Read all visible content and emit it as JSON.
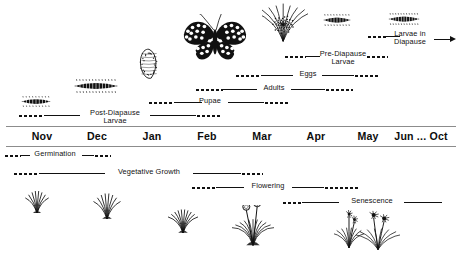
{
  "figure": {
    "ink_color": "#111111",
    "rule_color": "#8c8c8c",
    "background": "#ffffff"
  },
  "timeline": {
    "months": [
      {
        "label": "Nov",
        "x": 42
      },
      {
        "label": "Dec",
        "x": 97
      },
      {
        "label": "Jan",
        "x": 152
      },
      {
        "label": "Feb",
        "x": 207
      },
      {
        "label": "Mar",
        "x": 262
      },
      {
        "label": "Apr",
        "x": 316
      },
      {
        "label": "May",
        "x": 368
      },
      {
        "label": "Jun ... Oct",
        "x": 421
      }
    ]
  },
  "insect_stages": [
    {
      "name": "larvae-in-diapause",
      "label": "Larvae in\nDiapause",
      "label_line1": "Larvae in",
      "label_line2": "Diapause",
      "row_y": 36,
      "label_x": 410,
      "has_arrow": true,
      "segments": [
        {
          "kind": "dots",
          "x": 367,
          "w": 19
        },
        {
          "kind": "bar",
          "x": 386,
          "w": 14
        }
      ]
    },
    {
      "name": "pre-diapause-larvae",
      "label": "Pre-Diapause\nLarvae",
      "label_line1": "Pre-Diapause",
      "label_line2": "Larvae",
      "row_y": 56,
      "label_x": 343,
      "has_arrow": false,
      "segments": [
        {
          "kind": "dots",
          "x": 284,
          "w": 22
        },
        {
          "kind": "bar",
          "x": 306,
          "w": 14
        },
        {
          "kind": "dots",
          "x": 366,
          "w": 22
        }
      ]
    },
    {
      "name": "eggs",
      "label": "Eggs",
      "row_y": 75,
      "label_x": 308,
      "has_arrow": false,
      "segments": [
        {
          "kind": "dots",
          "x": 235,
          "w": 26
        },
        {
          "kind": "bar",
          "x": 261,
          "w": 32
        },
        {
          "kind": "bar",
          "x": 322,
          "w": 32
        },
        {
          "kind": "dots",
          "x": 354,
          "w": 26
        }
      ]
    },
    {
      "name": "adults",
      "label": "Adults",
      "row_y": 89,
      "label_x": 274,
      "has_arrow": false,
      "segments": [
        {
          "kind": "dots",
          "x": 195,
          "w": 28
        },
        {
          "kind": "bar",
          "x": 223,
          "w": 34
        },
        {
          "kind": "bar",
          "x": 291,
          "w": 34
        },
        {
          "kind": "dots",
          "x": 325,
          "w": 28
        }
      ]
    },
    {
      "name": "pupae",
      "label": "Pupae",
      "row_y": 102,
      "label_x": 210,
      "has_arrow": false,
      "segments": [
        {
          "kind": "dots",
          "x": 148,
          "w": 26
        },
        {
          "kind": "bar",
          "x": 174,
          "w": 28
        },
        {
          "kind": "bar",
          "x": 228,
          "w": 36
        },
        {
          "kind": "dots",
          "x": 264,
          "w": 26
        }
      ]
    },
    {
      "name": "post-diapause-larvae",
      "label": "Post-Diapause\nLarvae",
      "label_line1": "Post-Diapause",
      "label_line2": "Larvae",
      "row_y": 115,
      "label_x": 115,
      "has_arrow": false,
      "segments": [
        {
          "kind": "dots",
          "x": 18,
          "w": 26
        },
        {
          "kind": "bar",
          "x": 44,
          "w": 36
        },
        {
          "kind": "bar",
          "x": 150,
          "w": 46
        },
        {
          "kind": "dots",
          "x": 196,
          "w": 24
        }
      ]
    }
  ],
  "plant_stages": [
    {
      "name": "germination",
      "label": "Germination",
      "row_y": 155,
      "label_x": 55,
      "segments": [
        {
          "kind": "dots",
          "x": 4,
          "w": 17
        },
        {
          "kind": "bar",
          "x": 21,
          "w": 9
        },
        {
          "kind": "bar",
          "x": 82,
          "w": 12
        },
        {
          "kind": "dots",
          "x": 94,
          "w": 17
        }
      ]
    },
    {
      "name": "vegetative-growth",
      "label": "Vegetative Growth",
      "row_y": 173,
      "label_x": 149,
      "segments": [
        {
          "kind": "dots",
          "x": 13,
          "w": 26
        },
        {
          "kind": "bar",
          "x": 39,
          "w": 66
        },
        {
          "kind": "bar",
          "x": 193,
          "w": 48
        },
        {
          "kind": "dots",
          "x": 241,
          "w": 22
        }
      ]
    },
    {
      "name": "flowering",
      "label": "Flowering",
      "row_y": 187,
      "label_x": 268,
      "segments": [
        {
          "kind": "dots",
          "x": 191,
          "w": 25
        },
        {
          "kind": "bar",
          "x": 216,
          "w": 28
        },
        {
          "kind": "bar",
          "x": 292,
          "w": 32
        },
        {
          "kind": "dots",
          "x": 324,
          "w": 35
        }
      ]
    },
    {
      "name": "senescence",
      "label": "Senescence",
      "row_y": 202,
      "label_x": 372,
      "segments": [
        {
          "kind": "dots",
          "x": 282,
          "w": 20
        },
        {
          "kind": "bar",
          "x": 302,
          "w": 37
        },
        {
          "kind": "bar",
          "x": 404,
          "w": 38
        }
      ]
    }
  ],
  "illustrations": [
    {
      "name": "butterfly",
      "type": "butterfly",
      "x": 182,
      "y": 14,
      "w": 66,
      "h": 48
    },
    {
      "name": "larva-on-host-plant",
      "type": "larva-on-plant",
      "x": 262,
      "y": 2,
      "w": 46,
      "h": 40
    },
    {
      "name": "small-larva",
      "type": "larva-small",
      "x": 322,
      "y": 14,
      "w": 30,
      "h": 12
    },
    {
      "name": "diapause-larva",
      "type": "larva-diapause",
      "x": 387,
      "y": 13,
      "w": 34,
      "h": 12
    },
    {
      "name": "pupa",
      "type": "pupa",
      "x": 138,
      "y": 48,
      "w": 22,
      "h": 32
    },
    {
      "name": "post-diapause-larva-large",
      "type": "larva-large",
      "x": 72,
      "y": 79,
      "w": 48,
      "h": 14
    },
    {
      "name": "post-diapause-larva-small",
      "type": "larva-small2",
      "x": 20,
      "y": 96,
      "w": 32,
      "h": 11
    },
    {
      "name": "seedling-1",
      "type": "seedling",
      "x": 24,
      "y": 188,
      "w": 26,
      "h": 26
    },
    {
      "name": "seedling-2",
      "type": "seedling",
      "x": 92,
      "y": 190,
      "w": 30,
      "h": 30
    },
    {
      "name": "rosette",
      "type": "rosette",
      "x": 168,
      "y": 204,
      "w": 30,
      "h": 30
    },
    {
      "name": "flowering-plant",
      "type": "flowering-plant",
      "x": 232,
      "y": 205,
      "w": 42,
      "h": 44
    },
    {
      "name": "senescing-plant-1",
      "type": "senescing-plant",
      "x": 334,
      "y": 210,
      "w": 30,
      "h": 40
    },
    {
      "name": "senescing-plant-2",
      "type": "senescing-plant2",
      "x": 356,
      "y": 210,
      "w": 44,
      "h": 42
    }
  ]
}
